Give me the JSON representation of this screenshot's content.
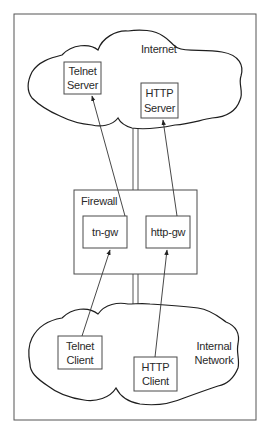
{
  "diagram": {
    "type": "network-proxy-firewall",
    "colors": {
      "background": "#ffffff",
      "stroke": "#333333",
      "text": "#2a2a2a"
    },
    "clouds": {
      "internet": {
        "label": "Internet"
      },
      "internal": {
        "label_line1": "Internal",
        "label_line2": "Network"
      }
    },
    "nodes": {
      "telnet_server": {
        "line1": "Telnet",
        "line2": "Server"
      },
      "http_server": {
        "line1": "HTTP",
        "line2": "Server"
      },
      "firewall": {
        "label": "Firewall"
      },
      "tn_gw": {
        "label": "tn-gw"
      },
      "http_gw": {
        "label": "http-gw"
      },
      "telnet_client": {
        "line1": "Telnet",
        "line2": "Client"
      },
      "http_client": {
        "line1": "HTTP",
        "line2": "Client"
      }
    },
    "edges": [
      {
        "from": "Telnet Client",
        "to": "tn-gw"
      },
      {
        "from": "tn-gw",
        "to": "Telnet Server"
      },
      {
        "from": "HTTP Client",
        "to": "http-gw"
      },
      {
        "from": "http-gw",
        "to": "HTTP Server"
      }
    ]
  }
}
